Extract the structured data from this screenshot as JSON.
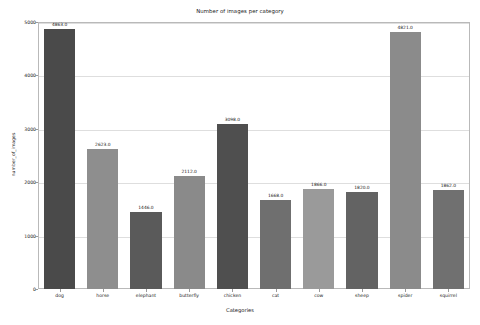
{
  "chart_data": {
    "type": "bar",
    "title": "Number of images per category",
    "xlabel": "Categories",
    "ylabel": "number_of_images",
    "categories": [
      "dog",
      "horse",
      "elephant",
      "butterfly",
      "chicken",
      "cat",
      "cow",
      "sheep",
      "spider",
      "squirrel"
    ],
    "values": [
      4863.0,
      2623.0,
      1446.0,
      2112.0,
      3098.0,
      1668.0,
      1866.0,
      1820.0,
      4821.0,
      1862.0
    ],
    "value_labels": [
      "4863.0",
      "2623.0",
      "1446.0",
      "2112.0",
      "3098.0",
      "1668.0",
      "1866.0",
      "1820.0",
      "4821.0",
      "1862.0"
    ],
    "ylim": [
      0,
      5000
    ],
    "yticks": [
      0,
      1000,
      2000,
      3000,
      4000,
      5000
    ],
    "ytick_labels": [
      "0",
      "1000",
      "2000",
      "3000",
      "4000",
      "5000"
    ],
    "grid": true,
    "legend": false,
    "bar_colors": [
      "#4a4a4a",
      "#8e8e8e",
      "#5a5a5a",
      "#8a8a8a",
      "#4f4f4f",
      "#6f6f6f",
      "#9a9a9a",
      "#636363",
      "#8b8b8b",
      "#707070"
    ]
  },
  "colors": {
    "plot_background": "#ffffff",
    "figure_background": "#ffffff",
    "gridline": "#dedede",
    "axis_border": "#b9b9b9",
    "text": "#1a1a1a"
  }
}
